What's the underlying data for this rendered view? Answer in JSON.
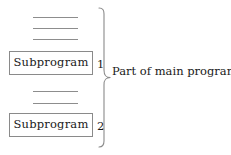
{
  "figure": {
    "name": "subprogram-structure-diagram",
    "background_color": "#ffffff",
    "line_color": "#8d8d8d",
    "box_border_color": "#8a8a8a",
    "text_color": "#1a1a1a"
  },
  "code_lines": {
    "group_upper_count": 3,
    "group_lower_count": 2,
    "description": "plain horizontal rules representing elided program statements"
  },
  "boxes": [
    {
      "label": "Subprogram",
      "index": "1"
    },
    {
      "label": "Subprogram",
      "index": "2"
    }
  ],
  "brace": {
    "caption": "Part of main program",
    "orientation": "right-facing-left-brace"
  }
}
